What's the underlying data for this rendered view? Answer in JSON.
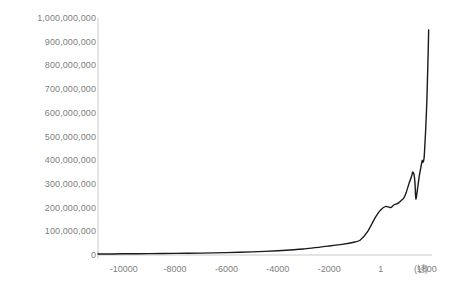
{
  "chart_data": {
    "type": "line",
    "title": "",
    "subtitle": "",
    "xlabel": "(년)",
    "ylabel": "",
    "xlim": [
      -11000,
      2000
    ],
    "ylim": [
      0,
      1000000000
    ],
    "grid": false,
    "legend": null,
    "legend_position": "none",
    "line_color": "#1a1a1a",
    "axis_color": "#bfbfbf",
    "tick_label_color": "#808080",
    "background_color": "#ffffff",
    "x_ticks": [
      {
        "value": -10000,
        "label": "-10000"
      },
      {
        "value": -8000,
        "label": "-8000"
      },
      {
        "value": -6000,
        "label": "-6000"
      },
      {
        "value": -4000,
        "label": "-4000"
      },
      {
        "value": -2000,
        "label": "-2000"
      },
      {
        "value": 1,
        "label": "1"
      },
      {
        "value": 1800,
        "label": "1800"
      }
    ],
    "y_ticks": [
      {
        "value": 0,
        "label": "0"
      },
      {
        "value": 100000000,
        "label": "100,000,000"
      },
      {
        "value": 200000000,
        "label": "200,000,000"
      },
      {
        "value": 300000000,
        "label": "300,000,000"
      },
      {
        "value": 400000000,
        "label": "400,000,000"
      },
      {
        "value": 500000000,
        "label": "500,000,000"
      },
      {
        "value": 600000000,
        "label": "600,000,000"
      },
      {
        "value": 700000000,
        "label": "700,000,000"
      },
      {
        "value": 800000000,
        "label": "800,000,000"
      },
      {
        "value": 900000000,
        "label": "900,000,000"
      },
      {
        "value": 1000000000,
        "label": "1,000,000,000"
      }
    ],
    "series": [
      {
        "name": "world-population",
        "x": [
          -11000,
          -10000,
          -9000,
          -8000,
          -7000,
          -6000,
          -5000,
          -4000,
          -3000,
          -2000,
          -1500,
          -1000,
          -800,
          -500,
          -300,
          -200,
          1,
          200,
          400,
          500,
          600,
          700,
          800,
          900,
          1000,
          1100,
          1200,
          1250,
          1300,
          1340,
          1360,
          1380,
          1400,
          1450,
          1500,
          1550,
          1600,
          1620,
          1650,
          1680,
          1700,
          1750,
          1800,
          1850,
          1870
        ],
        "y": [
          4000000,
          5000000,
          6000000,
          7000000,
          8000000,
          10000000,
          13000000,
          18000000,
          25000000,
          38000000,
          45000000,
          55000000,
          62000000,
          100000000,
          140000000,
          160000000,
          190000000,
          205000000,
          200000000,
          210000000,
          215000000,
          220000000,
          230000000,
          240000000,
          265000000,
          300000000,
          330000000,
          350000000,
          340000000,
          300000000,
          250000000,
          235000000,
          250000000,
          290000000,
          330000000,
          360000000,
          390000000,
          400000000,
          390000000,
          400000000,
          420000000,
          520000000,
          650000000,
          850000000,
          950000000
        ]
      }
    ],
    "annotations": []
  }
}
